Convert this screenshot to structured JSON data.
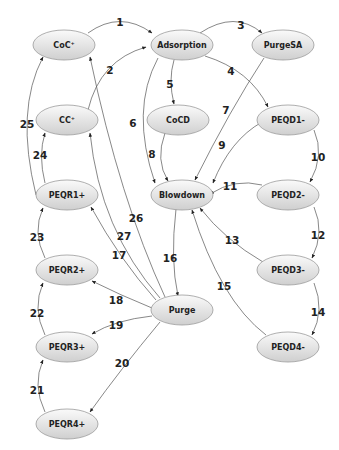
{
  "diagram": {
    "title": "",
    "node_fill_top": "#fafafa",
    "node_fill_bottom": "#cfcfcf",
    "nodes": [
      {
        "id": "CoC+",
        "label": "CoC⁺",
        "x": 64,
        "y": 45
      },
      {
        "id": "Adsorption",
        "label": "Adsorption",
        "x": 182,
        "y": 45
      },
      {
        "id": "PurgeSA",
        "label": "PurgeSA",
        "x": 283,
        "y": 45
      },
      {
        "id": "CC+",
        "label": "CC⁺",
        "x": 67,
        "y": 120
      },
      {
        "id": "CoCD",
        "label": "CoCD",
        "x": 178,
        "y": 120
      },
      {
        "id": "PEQD1-",
        "label": "PEQD1-",
        "x": 288,
        "y": 120
      },
      {
        "id": "PEQR1+",
        "label": "PEQR1+",
        "x": 67,
        "y": 195
      },
      {
        "id": "Blowdown",
        "label": "Blowdown",
        "x": 182,
        "y": 195
      },
      {
        "id": "PEQD2-",
        "label": "PEQD2-",
        "x": 288,
        "y": 195
      },
      {
        "id": "PEQR2+",
        "label": "PEQR2+",
        "x": 67,
        "y": 270
      },
      {
        "id": "Purge",
        "label": "Purge",
        "x": 182,
        "y": 310
      },
      {
        "id": "PEQD3-",
        "label": "PEQD3-",
        "x": 288,
        "y": 270
      },
      {
        "id": "PEQR3+",
        "label": "PEQR3+",
        "x": 67,
        "y": 347
      },
      {
        "id": "PEQD4-",
        "label": "PEQD4-",
        "x": 288,
        "y": 347
      },
      {
        "id": "PEQR4+",
        "label": "PEQR4+",
        "x": 67,
        "y": 424
      }
    ],
    "edges": [
      {
        "label": "1",
        "from": "CoC+",
        "to": "Adsorption",
        "path": "M88,33 Q120,10 152,33",
        "lx": 120,
        "ly": 22
      },
      {
        "label": "2",
        "from": "CC+",
        "to": "Adsorption",
        "path": "M88,110 Q100,60 146,47",
        "lx": 110,
        "ly": 70
      },
      {
        "label": "3",
        "from": "Adsorption",
        "to": "PurgeSA",
        "path": "M200,33 Q235,10 262,33",
        "lx": 241,
        "ly": 25
      },
      {
        "label": "4",
        "from": "Adsorption",
        "to": "PEQD1-",
        "path": "M205,56 Q250,70 268,107",
        "lx": 231,
        "ly": 71
      },
      {
        "label": "5",
        "from": "Adsorption",
        "to": "CoCD",
        "path": "M174,60 Q168,80 174,104",
        "lx": 170,
        "ly": 84
      },
      {
        "label": "6",
        "from": "Adsorption",
        "to": "Blowdown",
        "path": "M158,58 Q130,110 155,183",
        "lx": 133,
        "ly": 123
      },
      {
        "label": "7",
        "from": "PurgeSA",
        "to": "Blowdown",
        "path": "M264,58 Q230,110 195,180",
        "lx": 226,
        "ly": 110
      },
      {
        "label": "8",
        "from": "CoCD",
        "to": "Blowdown",
        "path": "M165,133 Q155,160 168,181",
        "lx": 152,
        "ly": 154
      },
      {
        "label": "9",
        "from": "PEQD1-",
        "to": "Blowdown",
        "path": "M262,122 Q230,140 213,183",
        "lx": 222,
        "ly": 145
      },
      {
        "label": "10",
        "from": "PEQD1-",
        "to": "PEQD2-",
        "path": "M314,130 Q325,155 310,182",
        "lx": 318,
        "ly": 157
      },
      {
        "label": "11",
        "from": "PEQD2-",
        "to": "Blowdown",
        "path": "M262,185 Q235,178 210,194",
        "lx": 230,
        "ly": 186
      },
      {
        "label": "12",
        "from": "PEQD2-",
        "to": "PEQD3-",
        "path": "M314,207 Q325,232 312,258",
        "lx": 318,
        "ly": 235
      },
      {
        "label": "13",
        "from": "PEQD3-",
        "to": "Blowdown",
        "path": "M263,262 Q225,240 200,208",
        "lx": 232,
        "ly": 240
      },
      {
        "label": "14",
        "from": "PEQD3-",
        "to": "PEQD4-",
        "path": "M314,283 Q325,310 312,335",
        "lx": 318,
        "ly": 312
      },
      {
        "label": "15",
        "from": "PEQD4-",
        "to": "Blowdown",
        "path": "M266,335 Q220,300 192,210",
        "lx": 224,
        "ly": 286
      },
      {
        "label": "16",
        "from": "Blowdown",
        "to": "Purge",
        "path": "M176,209 Q170,260 178,296",
        "lx": 170,
        "ly": 258
      },
      {
        "label": "17",
        "from": "Purge",
        "to": "PEQR1+",
        "path": "M156,300 Q120,260 91,207",
        "lx": 119,
        "ly": 255
      },
      {
        "label": "18",
        "from": "Purge",
        "to": "PEQR2+",
        "path": "M152,308 Q120,295 92,281",
        "lx": 116,
        "ly": 300
      },
      {
        "label": "19",
        "from": "Purge",
        "to": "PEQR3+",
        "path": "M152,316 Q115,320 92,334",
        "lx": 116,
        "ly": 325
      },
      {
        "label": "20",
        "from": "Purge",
        "to": "PEQR4+",
        "path": "M160,322 Q120,370 90,412",
        "lx": 122,
        "ly": 363
      },
      {
        "label": "21",
        "from": "PEQR4+",
        "to": "PEQR3+",
        "path": "M45,412 Q32,385 43,360",
        "lx": 37,
        "ly": 390
      },
      {
        "label": "22",
        "from": "PEQR3+",
        "to": "PEQR2+",
        "path": "M45,335 Q32,308 43,283",
        "lx": 37,
        "ly": 313
      },
      {
        "label": "23",
        "from": "PEQR2+",
        "to": "PEQR1+",
        "path": "M45,258 Q32,232 43,208",
        "lx": 37,
        "ly": 237
      },
      {
        "label": "24",
        "from": "PEQR1+",
        "to": "CC+",
        "path": "M45,183 Q38,155 45,133",
        "lx": 40,
        "ly": 155
      },
      {
        "label": "25",
        "from": "PEQR1+",
        "to": "CoC+",
        "path": "M36,195 Q15,110 43,57",
        "lx": 27,
        "ly": 124
      },
      {
        "label": "26",
        "from": "Purge",
        "to": "CoC+",
        "path": "M165,297 Q120,200 90,57",
        "lx": 136,
        "ly": 218
      },
      {
        "label": "27",
        "from": "Purge",
        "to": "CC+",
        "path": "M160,298 Q100,230 90,133",
        "lx": 124,
        "ly": 236
      }
    ]
  }
}
